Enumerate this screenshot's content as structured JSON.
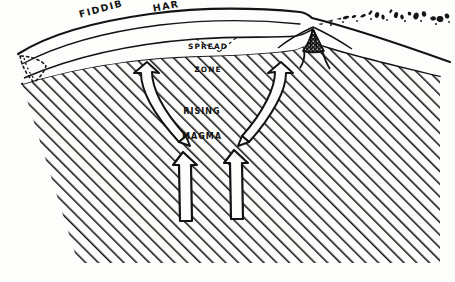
{
  "figure": {
    "kind": "geological-cross-section",
    "background_color": "#fdfdfc",
    "ink_color": "#131313"
  },
  "labels": {
    "surface_left": "FIDDIB",
    "surface_right": "HAR",
    "spread_zone_line1": "SPREAD",
    "spread_zone_line2": "ZONE",
    "rising_magma_line1": "RISING",
    "rising_magma_line2": "MAGMA"
  },
  "features": [
    {
      "name": "ground-surface-line",
      "description": "arched upper surface line crossing the whole width"
    },
    {
      "name": "crust-layer",
      "description": "thin lens-shaped layer beneath the surface line"
    },
    {
      "name": "mantle-body",
      "description": "large diagonally hatched region filling the lower figure"
    },
    {
      "name": "spread-zone",
      "description": "central zone where crust separates"
    },
    {
      "name": "volcanic-vent",
      "description": "dark stippled conduit reaching the surface at the right"
    },
    {
      "name": "eruption-ejecta",
      "description": "scatter of ejected debris flung to the upper right"
    },
    {
      "name": "magma-arrow-left",
      "description": "curved arrow diverging left from the spread zone"
    },
    {
      "name": "magma-arrow-right",
      "description": "curved arrow diverging right from the spread zone"
    },
    {
      "name": "upwelling-arrow-left",
      "description": "vertical outlined arrow pointing up"
    },
    {
      "name": "upwelling-arrow-right",
      "description": "vertical outlined arrow pointing up"
    },
    {
      "name": "left-fault-dotted",
      "description": "dotted outline of a buried block at the left margin"
    }
  ]
}
